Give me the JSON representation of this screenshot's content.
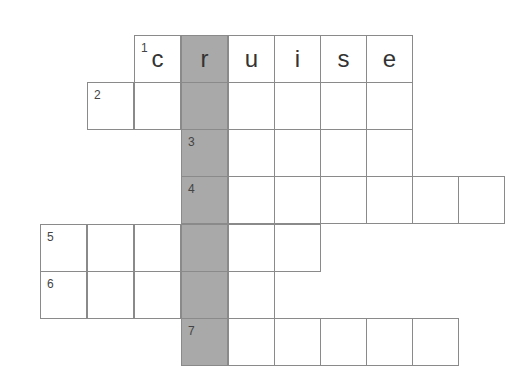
{
  "puzzle": {
    "type": "crossword",
    "colors": {
      "border": "#8a8a8a",
      "shaded": "#a9a9a9",
      "cell": "#ffffff"
    },
    "shaded_column": 3,
    "rows": [
      {
        "number": "1",
        "start_col": 0,
        "length": 6,
        "offset_col": 2,
        "letters": [
          "c",
          "r",
          "u",
          "i",
          "s",
          "e"
        ]
      },
      {
        "number": "2",
        "start_col": 1,
        "length": 7,
        "letters": [
          "",
          "",
          "",
          "",
          "",
          "",
          ""
        ]
      },
      {
        "number": "3",
        "start_col": 3,
        "length": 5,
        "letters": [
          "",
          "",
          "",
          "",
          ""
        ]
      },
      {
        "number": "4",
        "start_col": 3,
        "length": 7,
        "letters": [
          "",
          "",
          "",
          "",
          "",
          "",
          ""
        ]
      },
      {
        "number": "5",
        "start_col": 0,
        "length": 6,
        "letters": [
          "",
          "",
          "",
          "",
          "",
          ""
        ]
      },
      {
        "number": "6",
        "start_col": 0,
        "length": 5,
        "letters": [
          "",
          "",
          "",
          "",
          ""
        ]
      },
      {
        "number": "7",
        "start_col": 3,
        "length": 6,
        "letters": [
          "",
          "",
          "",
          "",
          "",
          ""
        ]
      }
    ]
  }
}
